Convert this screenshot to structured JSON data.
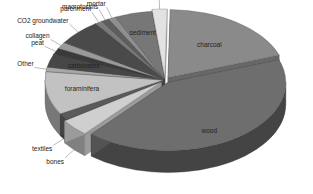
{
  "chart_data": {
    "type": "pie",
    "style": "3d-exploded",
    "title": "",
    "categories": [
      "charcoal",
      "wood",
      "bones",
      "textiles",
      "foraminifera",
      "Other",
      "carbonates",
      "peat",
      "collagen",
      "CO2 groundwater",
      "parchment",
      "macrofossils",
      "mortar",
      "sediment",
      "tooth&ivory"
    ],
    "values": [
      19,
      41,
      4,
      1.5,
      10,
      1,
      3,
      1.5,
      1.5,
      6,
      1,
      1,
      1,
      5,
      2
    ],
    "unit": "%",
    "legend": "none (direct labels)",
    "label_placement": {
      "inside": [
        "charcoal",
        "wood",
        "foraminifera",
        "carbonates",
        "sediment"
      ],
      "outside": [
        "bones",
        "textiles",
        "Other",
        "peat",
        "collagen",
        "CO2 groundwater",
        "parchment",
        "macrofossils",
        "mortar",
        "tooth&ivory"
      ]
    },
    "colors": {
      "charcoal": "#8a8a8a",
      "wood": "#6e6e6e",
      "bones": "#cfcfcf",
      "textiles": "#5a5a5a",
      "foraminifera": "#c2c2c2",
      "Other": "#a8a8a8",
      "carbonates": "#474747",
      "peat": "#3a3a3a",
      "collagen": "#9a9a9a",
      "CO2 groundwater": "#4a4a4a",
      "parchment": "#7a7a7a",
      "macrofossils": "#5e5e5e",
      "mortar": "#8f8f8f",
      "sediment": "#777777",
      "tooth&ivory": "#e2e2e2"
    }
  }
}
